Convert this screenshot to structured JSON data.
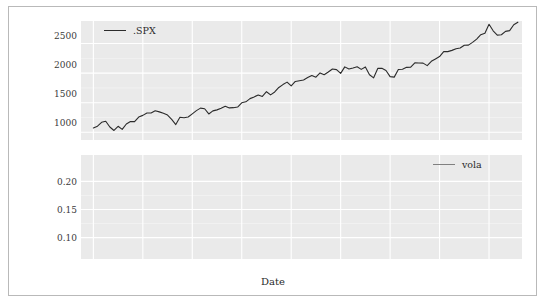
{
  "figure": {
    "background": "#ffffff",
    "border_color": "#b9b9b9",
    "panel_background": "#eaeaea",
    "grid_color": "#ffffff"
  },
  "xlabel": "Date",
  "xticks": [
    "2010",
    "2011",
    "2012",
    "2013",
    "2014",
    "2015",
    "2016",
    "2017",
    "2018"
  ],
  "panels": [
    {
      "name": "spx-panel",
      "legend_label": ".SPX",
      "legend_color": "#2b2b2b",
      "yticks": [
        "1000",
        "1500",
        "2000",
        "2500"
      ]
    },
    {
      "name": "vola-panel",
      "legend_label": "vola",
      "legend_color": "#808080",
      "yticks": [
        "0.10",
        "0.15",
        "0.20"
      ]
    }
  ],
  "chart_data": [
    {
      "type": "line",
      "name": "spx",
      "title": "",
      "xlabel": "Date",
      "ylabel": "",
      "legend": [
        ".SPX"
      ],
      "legend_position": "top-left",
      "grid": true,
      "xlim": [
        "2009-10-01",
        "2018-09-01"
      ],
      "ylim": [
        870,
        2880
      ],
      "ytick_values": [
        1000,
        1500,
        2000,
        2500
      ],
      "xtick_labels": [
        "2010",
        "2011",
        "2012",
        "2013",
        "2014",
        "2015",
        "2016",
        "2017",
        "2018"
      ],
      "series": [
        {
          "name": ".SPX",
          "color": "#2b2b2b",
          "x": [
            "2010-01",
            "2010-02",
            "2010-03",
            "2010-04",
            "2010-05",
            "2010-06",
            "2010-07",
            "2010-08",
            "2010-09",
            "2010-10",
            "2010-11",
            "2010-12",
            "2011-01",
            "2011-02",
            "2011-03",
            "2011-04",
            "2011-05",
            "2011-06",
            "2011-07",
            "2011-08",
            "2011-09",
            "2011-10",
            "2011-11",
            "2011-12",
            "2012-01",
            "2012-02",
            "2012-03",
            "2012-04",
            "2012-05",
            "2012-06",
            "2012-07",
            "2012-08",
            "2012-09",
            "2012-10",
            "2012-11",
            "2012-12",
            "2013-01",
            "2013-02",
            "2013-03",
            "2013-04",
            "2013-05",
            "2013-06",
            "2013-07",
            "2013-08",
            "2013-09",
            "2013-10",
            "2013-11",
            "2013-12",
            "2014-01",
            "2014-02",
            "2014-03",
            "2014-04",
            "2014-05",
            "2014-06",
            "2014-07",
            "2014-08",
            "2014-09",
            "2014-10",
            "2014-11",
            "2014-12",
            "2015-01",
            "2015-02",
            "2015-03",
            "2015-04",
            "2015-05",
            "2015-06",
            "2015-07",
            "2015-08",
            "2015-09",
            "2015-10",
            "2015-11",
            "2015-12",
            "2016-01",
            "2016-02",
            "2016-03",
            "2016-04",
            "2016-05",
            "2016-06",
            "2016-07",
            "2016-08",
            "2016-09",
            "2016-10",
            "2016-11",
            "2016-12",
            "2017-01",
            "2017-02",
            "2017-03",
            "2017-04",
            "2017-05",
            "2017-06",
            "2017-07",
            "2017-08",
            "2017-09",
            "2017-10",
            "2017-11",
            "2017-12",
            "2018-01",
            "2018-02",
            "2018-03",
            "2018-04",
            "2018-05",
            "2018-06",
            "2018-07",
            "2018-08"
          ],
          "values": [
            1074,
            1104,
            1169,
            1187,
            1089,
            1031,
            1102,
            1049,
            1141,
            1183,
            1181,
            1258,
            1286,
            1327,
            1326,
            1364,
            1345,
            1321,
            1292,
            1219,
            1131,
            1253,
            1247,
            1258,
            1312,
            1366,
            1408,
            1398,
            1310,
            1362,
            1379,
            1407,
            1441,
            1412,
            1416,
            1426,
            1498,
            1515,
            1569,
            1598,
            1631,
            1606,
            1686,
            1633,
            1682,
            1757,
            1806,
            1848,
            1783,
            1859,
            1872,
            1884,
            1924,
            1960,
            1930,
            2003,
            1972,
            2018,
            2068,
            2059,
            1995,
            2105,
            2068,
            2086,
            2107,
            2063,
            2104,
            1972,
            1920,
            2079,
            2080,
            2044,
            1940,
            1932,
            2060,
            2065,
            2097,
            2099,
            2174,
            2171,
            2168,
            2126,
            2199,
            2239,
            2279,
            2364,
            2363,
            2384,
            2412,
            2423,
            2470,
            2472,
            2519,
            2575,
            2648,
            2674,
            2824,
            2714,
            2641,
            2648,
            2705,
            2718,
            2816,
            2860
          ]
        }
      ]
    },
    {
      "type": "line",
      "name": "vola",
      "title": "",
      "xlabel": "Date",
      "ylabel": "",
      "legend": [
        "vola"
      ],
      "legend_position": "top-right",
      "grid": true,
      "xlim": [
        "2009-10-01",
        "2018-09-01"
      ],
      "ylim": [
        0.062,
        0.247
      ],
      "ytick_values": [
        0.1,
        0.15,
        0.2
      ],
      "xtick_labels": [
        "2010",
        "2011",
        "2012",
        "2013",
        "2014",
        "2015",
        "2016",
        "2017",
        "2018"
      ],
      "series": [
        {
          "name": "vola",
          "color": "#808080",
          "x": [
            "2011-01",
            "2011-02",
            "2011-03",
            "2011-04",
            "2011-05",
            "2011-06",
            "2011-07",
            "2011-08",
            "2011-09",
            "2011-10",
            "2011-11",
            "2011-12",
            "2012-01",
            "2012-02",
            "2012-03",
            "2012-04",
            "2012-05",
            "2012-06",
            "2012-07",
            "2012-08",
            "2012-09",
            "2012-10",
            "2012-11",
            "2012-12",
            "2013-01",
            "2013-02",
            "2013-03",
            "2013-04",
            "2013-05",
            "2013-06",
            "2013-07",
            "2013-08",
            "2013-09",
            "2013-10",
            "2013-11",
            "2013-12",
            "2014-01",
            "2014-02",
            "2014-03",
            "2014-04",
            "2014-05",
            "2014-06",
            "2014-07",
            "2014-08",
            "2014-09",
            "2014-10",
            "2014-11",
            "2014-12",
            "2015-01",
            "2015-02",
            "2015-03",
            "2015-04",
            "2015-05",
            "2015-06",
            "2015-07",
            "2015-08",
            "2015-09",
            "2015-10",
            "2015-11",
            "2015-12",
            "2016-01",
            "2016-02",
            "2016-03",
            "2016-04",
            "2016-05",
            "2016-06",
            "2016-07",
            "2016-08",
            "2016-09",
            "2016-10",
            "2016-11",
            "2016-12",
            "2017-01",
            "2017-02",
            "2017-03",
            "2017-04",
            "2017-05",
            "2017-06",
            "2017-07",
            "2017-08",
            "2017-09",
            "2017-10",
            "2017-11",
            "2017-12",
            "2018-01",
            "2018-02",
            "2018-03",
            "2018-04",
            "2018-05",
            "2018-06",
            "2018-07",
            "2018-08"
          ],
          "values": [
            0.175,
            0.176,
            0.172,
            0.17,
            0.173,
            0.17,
            0.164,
            0.148,
            0.135,
            0.131,
            0.175,
            0.205,
            0.222,
            0.228,
            0.229,
            0.228,
            0.226,
            0.225,
            0.228,
            0.229,
            0.229,
            0.228,
            0.228,
            0.226,
            0.213,
            0.196,
            0.175,
            0.158,
            0.14,
            0.131,
            0.129,
            0.129,
            0.13,
            0.129,
            0.128,
            0.127,
            0.126,
            0.127,
            0.127,
            0.126,
            0.124,
            0.122,
            0.121,
            0.121,
            0.12,
            0.12,
            0.119,
            0.118,
            0.116,
            0.114,
            0.112,
            0.11,
            0.109,
            0.109,
            0.111,
            0.113,
            0.112,
            0.114,
            0.115,
            0.117,
            0.119,
            0.118,
            0.119,
            0.118,
            0.117,
            0.118,
            0.152,
            0.156,
            0.158,
            0.16,
            0.163,
            0.168,
            0.17,
            0.169,
            0.168,
            0.17,
            0.171,
            0.172,
            0.17,
            0.15,
            0.148,
            0.147,
            0.146,
            0.141,
            0.135,
            0.126,
            0.119,
            0.113,
            0.11,
            0.108,
            0.098,
            0.1,
            0.096,
            0.088,
            0.082,
            0.08,
            0.081,
            0.093,
            0.108,
            0.117,
            0.12,
            0.121,
            0.122,
            0.123
          ]
        }
      ]
    }
  ]
}
